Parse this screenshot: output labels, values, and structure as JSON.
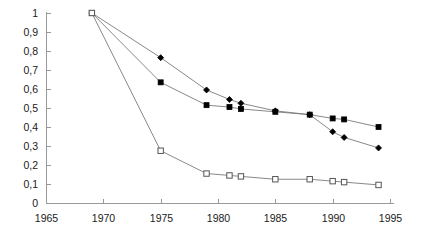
{
  "chart_data": {
    "type": "line",
    "title": "",
    "subtitle": "",
    "xlabel": "",
    "ylabel": "",
    "xlim": [
      1965,
      1995
    ],
    "ylim": [
      0,
      1
    ],
    "grid": false,
    "legend": "none",
    "x_ticks": [
      1965,
      1970,
      1975,
      1980,
      1985,
      1990,
      1995
    ],
    "x_tick_labels": [
      "1965",
      "1970",
      "1975",
      "1980",
      "1985",
      "1990",
      "1995"
    ],
    "y_ticks": [
      0,
      0.1,
      0.2,
      0.3,
      0.4,
      0.5,
      0.6,
      0.7,
      0.8,
      0.9,
      1
    ],
    "y_tick_labels": [
      "0",
      "0,1",
      "0,2",
      "0,3",
      "0,4",
      "0,5",
      "0,6",
      "0,7",
      "0,8",
      "0,9",
      "1"
    ],
    "decimal_separator": ",",
    "series": [
      {
        "name": "series-diamond",
        "marker": "filled-diamond",
        "color": "#000000",
        "line_color": "#7a7a7a",
        "x": [
          1969,
          1975,
          1979,
          1981,
          1982,
          1985,
          1988,
          1990,
          1991,
          1994
        ],
        "values": [
          1.0,
          0.765,
          0.595,
          0.545,
          0.525,
          0.485,
          0.465,
          0.375,
          0.345,
          0.29
        ]
      },
      {
        "name": "series-filled-square",
        "marker": "filled-square",
        "color": "#000000",
        "line_color": "#7a7a7a",
        "x": [
          1969,
          1975,
          1979,
          1981,
          1982,
          1985,
          1988,
          1990,
          1991,
          1994
        ],
        "values": [
          1.0,
          0.635,
          0.515,
          0.505,
          0.495,
          0.48,
          0.465,
          0.445,
          0.44,
          0.4
        ]
      },
      {
        "name": "series-open-square",
        "marker": "open-square",
        "color": "#ffffff",
        "line_color": "#7a7a7a",
        "x": [
          1969,
          1975,
          1979,
          1981,
          1982,
          1985,
          1988,
          1990,
          1991,
          1994
        ],
        "values": [
          1.0,
          0.275,
          0.155,
          0.145,
          0.14,
          0.125,
          0.125,
          0.115,
          0.11,
          0.095
        ]
      }
    ]
  },
  "geometry": {
    "x0_px": 46,
    "x1_px": 390,
    "y0_px": 203,
    "y1_px": 13,
    "tick_len": 4,
    "x_label_y": 222,
    "y_label_dx": -8
  }
}
